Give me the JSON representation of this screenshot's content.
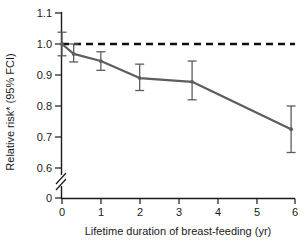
{
  "figure": {
    "background_color": "#ffffff",
    "line_color": "#5d5d5d",
    "reference_color": "#111111"
  },
  "axis": {
    "y_title": "Relative risk* (95% FCI)",
    "x_title": "Lifetime duration of breast-feeding (yr)",
    "y_ticks": [
      "0",
      "0.6",
      "0.7",
      "0.8",
      "0.9",
      "1.0",
      "1.1"
    ],
    "x_ticks": [
      "0",
      "1",
      "2",
      "3",
      "4",
      "5",
      "6"
    ],
    "y_axis_break": true
  },
  "chart_data": {
    "type": "line",
    "title": "",
    "xlabel": "Lifetime duration of breast-feeding (yr)",
    "ylabel": "Relative risk* (95% FCI)",
    "xlim": [
      0,
      6
    ],
    "ylim": [
      0.6,
      1.1
    ],
    "grid": false,
    "legend": "none",
    "axis_break": {
      "axis": "y",
      "from": 0,
      "to": 0.6
    },
    "reference_line": {
      "y": 1.0,
      "style": "dashed",
      "label": "null effect (RR = 1.0)"
    },
    "x": [
      0,
      0.3,
      1.0,
      2.0,
      3.35,
      5.9
    ],
    "values": [
      1.0,
      0.968,
      0.945,
      0.89,
      0.878,
      0.725
    ],
    "ci_lower": [
      0.962,
      0.942,
      0.915,
      0.85,
      0.82,
      0.65
    ],
    "ci_upper": [
      1.038,
      1.0,
      0.975,
      0.935,
      0.945,
      0.8
    ],
    "series": [
      {
        "name": "Relative risk",
        "values": [
          1.0,
          0.968,
          0.945,
          0.89,
          0.878,
          0.725
        ]
      }
    ],
    "annotations": [
      "* adjusted relative risk with 95% floated confidence interval"
    ]
  }
}
